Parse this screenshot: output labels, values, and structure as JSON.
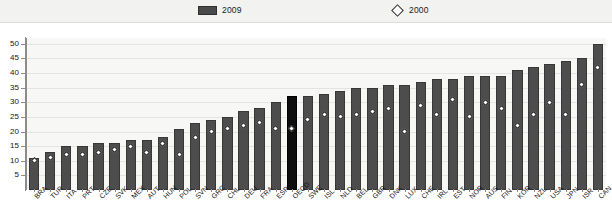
{
  "legend": {
    "items": [
      {
        "label": "2009",
        "type": "bar",
        "color": "#4d4d4d"
      },
      {
        "label": "2000",
        "type": "diamond",
        "color": "#ffffff"
      }
    ]
  },
  "axis": {
    "y_ticks": [
      "5",
      "10",
      "15",
      "20",
      "25",
      "30",
      "35",
      "40",
      "45",
      "50"
    ]
  },
  "chart_data": {
    "type": "bar",
    "title": "",
    "subtitle": "",
    "xlabel": "",
    "ylabel": "",
    "ylim": [
      0,
      52
    ],
    "ytick_values": [
      5,
      10,
      15,
      20,
      25,
      30,
      35,
      40,
      45,
      50
    ],
    "grid": true,
    "legend_position": "top",
    "highlight_category": "OECD",
    "highlight_color": "#0d0d0d",
    "bar_color": "#4d4d4d",
    "marker_color": "#ffffff",
    "categories": [
      "BRA",
      "TUR",
      "ITA",
      "PRT",
      "CZE",
      "SVK",
      "MEX",
      "AUT",
      "HUN",
      "POL",
      "SVN",
      "GRC",
      "CHL",
      "DEU",
      "FRA",
      "ESP",
      "OECD",
      "SWE",
      "ISL",
      "NLD",
      "BEL",
      "GBR",
      "DNK",
      "LUX",
      "CHE",
      "IRL",
      "EST",
      "NOR",
      "AUS",
      "FIN",
      "KOR",
      "NZL",
      "USA",
      "JPN",
      "ISR",
      "CAN"
    ],
    "series": [
      {
        "name": "2009",
        "type": "bar",
        "values": [
          11,
          13,
          15,
          15,
          16,
          16,
          17,
          17,
          18,
          21,
          23,
          24,
          25,
          27,
          28,
          30,
          32,
          32,
          33,
          34,
          35,
          35,
          36,
          36,
          37,
          38,
          38,
          39,
          39,
          39,
          41,
          42,
          43,
          44,
          45,
          50
        ]
      },
      {
        "name": "2000",
        "type": "scatter",
        "values": [
          10,
          11,
          12,
          12,
          13,
          14,
          15,
          13,
          16,
          12,
          18,
          20,
          21,
          22,
          23,
          21,
          21,
          24,
          26,
          25,
          26,
          27,
          28,
          20,
          29,
          26,
          31,
          25,
          30,
          28,
          22,
          26,
          30,
          26,
          36,
          42
        ]
      }
    ]
  }
}
